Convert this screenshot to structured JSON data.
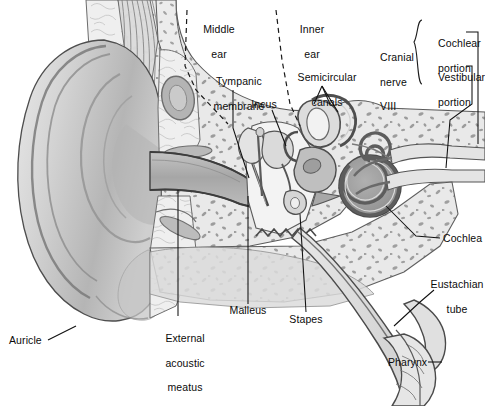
{
  "figure": {
    "type": "anatomical-diagram",
    "width": 485,
    "height": 406,
    "background_color": "#ffffff",
    "line_color": "#1a1a1a",
    "palette": {
      "outline": "#3a3a3a",
      "dark_gray": "#6f6f6f",
      "mid_gray": "#9a9a9a",
      "light_gray": "#c9c9c9",
      "pale_gray": "#e2e2e2",
      "very_pale": "#efefef",
      "bone_fill": "#e8e8e8",
      "cartilage_fill": "#d3d3d3",
      "canal_fill": "#b9b9b9",
      "membrane_gray": "#8d8d8d",
      "leader_line": "#111111"
    }
  },
  "regions": {
    "middle_ear": {
      "label": "Middle\near",
      "x": 212,
      "y": 14
    },
    "inner_ear": {
      "label": "Inner\near",
      "x": 306,
      "y": 14
    }
  },
  "labels": [
    {
      "id": "middle-ear",
      "text": "Middle\near",
      "x": 212,
      "y": 14,
      "align": "center"
    },
    {
      "id": "inner-ear",
      "text": "Inner\near",
      "x": 306,
      "y": 14,
      "align": "center"
    },
    {
      "id": "tympanic-membrane",
      "text": "Tympanic\nmembrane",
      "x": 230,
      "y": 66,
      "align": "center"
    },
    {
      "id": "semicircular-canals",
      "text": "Semicircular\ncanals",
      "x": 320,
      "y": 62,
      "align": "center"
    },
    {
      "id": "incus",
      "text": "Incus",
      "x": 264,
      "y": 100,
      "align": "center"
    },
    {
      "id": "cranial-nerve",
      "text": "Cranial\nnerve\nVIII",
      "x": 385,
      "y": 30,
      "align": "left"
    },
    {
      "id": "cochlear-portion",
      "text": "Cochlear\nportion",
      "x": 427,
      "y": 26,
      "align": "left"
    },
    {
      "id": "vestibular-portion",
      "text": "Vestibular\nportion",
      "x": 427,
      "y": 60,
      "align": "left"
    },
    {
      "id": "cochlea",
      "text": "Cochlea",
      "x": 443,
      "y": 234,
      "align": "left"
    },
    {
      "id": "eustachian-tube",
      "text": "Eustachian\ntube",
      "x": 427,
      "y": 268,
      "align": "left"
    },
    {
      "id": "pharynx",
      "text": "Pharynx",
      "x": 389,
      "y": 358,
      "align": "left"
    },
    {
      "id": "malleus",
      "text": "Malleus",
      "x": 244,
      "y": 310,
      "align": "center"
    },
    {
      "id": "stapes",
      "text": "Stapes",
      "x": 305,
      "y": 318,
      "align": "center"
    },
    {
      "id": "external-acoustic-meatus",
      "text": "External\nacoustic\nmeatus",
      "x": 180,
      "y": 322,
      "align": "center"
    },
    {
      "id": "auricle",
      "text": "Auricle",
      "x": 10,
      "y": 337,
      "align": "left"
    }
  ],
  "label_text": {
    "middle_ear_line1": "Middle",
    "middle_ear_line2": "ear",
    "inner_ear_line1": "Inner",
    "inner_ear_line2": "ear",
    "tympanic_line1": "Tympanic",
    "tympanic_line2": "membrane",
    "semicircular_line1": "Semicircular",
    "semicircular_line2": "canals",
    "incus": "Incus",
    "cranial_line1": "Cranial",
    "cranial_line2": "nerve",
    "cranial_line3": "VIII",
    "cochlear_line1": "Cochlear",
    "cochlear_line2": "portion",
    "vestibular_line1": "Vestibular",
    "vestibular_line2": "portion",
    "cochlea": "Cochlea",
    "eustachian_line1": "Eustachian",
    "eustachian_line2": "tube",
    "pharynx": "Pharynx",
    "malleus": "Malleus",
    "stapes": "Stapes",
    "eam_line1": "External",
    "eam_line2": "acoustic",
    "eam_line3": "meatus",
    "auricle": "Auricle"
  },
  "structures": [
    {
      "name": "auricle",
      "description": "Outer ear pinna, large shaded cartilage flap on left"
    },
    {
      "name": "external-acoustic-meatus",
      "description": "Ear canal running diagonally from auricle to tympanic membrane"
    },
    {
      "name": "tympanic-membrane",
      "description": "Eardrum at inner end of ear canal"
    },
    {
      "name": "malleus",
      "description": "Hammer ossicle attached to tympanic membrane"
    },
    {
      "name": "incus",
      "description": "Anvil ossicle in middle ear cavity"
    },
    {
      "name": "stapes",
      "description": "Stirrup ossicle at oval window"
    },
    {
      "name": "semicircular-canals",
      "description": "Three looping canals of vestibular apparatus"
    },
    {
      "name": "cochlea",
      "description": "Spiral snail-shaped organ of hearing"
    },
    {
      "name": "cranial-nerve-viii",
      "description": "Vestibulocochlear nerve with cochlear and vestibular portions"
    },
    {
      "name": "eustachian-tube",
      "description": "Auditory tube running down-right toward pharynx"
    },
    {
      "name": "pharynx",
      "description": "Throat opening at lower right terminus of eustachian tube"
    },
    {
      "name": "temporal-bone",
      "description": "Stippled trabecular bone surrounding middle and inner ear"
    }
  ],
  "dividers": [
    {
      "name": "outer-middle-ear-boundary",
      "style": "dashed"
    },
    {
      "name": "middle-inner-ear-boundary",
      "style": "dashed"
    }
  ],
  "brace": {
    "name": "cranial-nerve-brace",
    "orientation": "left-facing"
  }
}
